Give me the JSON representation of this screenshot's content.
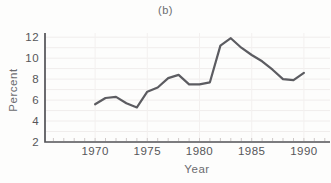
{
  "chart_data": {
    "type": "line",
    "title": "(b)",
    "xlabel": "Year",
    "ylabel": "Percent",
    "x": [
      1970,
      1971,
      1972,
      1973,
      1974,
      1975,
      1976,
      1977,
      1978,
      1979,
      1980,
      1981,
      1982,
      1983,
      1984,
      1985,
      1986,
      1987,
      1988,
      1989,
      1990
    ],
    "values": [
      5.6,
      6.2,
      6.3,
      5.7,
      5.3,
      6.8,
      7.2,
      8.1,
      8.4,
      7.5,
      7.5,
      7.7,
      11.2,
      11.9,
      11.0,
      10.3,
      9.7,
      8.9,
      8.0,
      7.9,
      8.6
    ],
    "series_name": "Percent",
    "xticks": [
      1970,
      1975,
      1980,
      1985,
      1990
    ],
    "yticks": [
      2,
      4,
      6,
      8,
      10,
      12
    ],
    "minor_xtick_start": 1966,
    "minor_xtick_end": 1992,
    "xlim": [
      1965.2,
      1992.5
    ],
    "ylim": [
      2,
      12.4
    ],
    "grid": true,
    "legend": false
  },
  "colors": {
    "line": "#5c5c61",
    "axis": "#525256",
    "tick_text": "#565659",
    "label_text": "#6b6b6f",
    "grid_h": "#f0edec",
    "grid_v": "#f3f0ef",
    "minor_tick": "#cfc9c8",
    "background": "#fdfdfc"
  }
}
